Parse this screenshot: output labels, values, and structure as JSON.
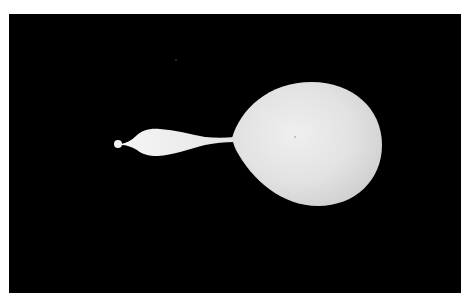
{
  "image": {
    "subject": "liquid droplet with pinching tail (high-speed photograph)",
    "background_color": "#000000",
    "border_color": "#ffffff",
    "droplet_color": "#e6e6e6",
    "highlight_color": "#f4f4f4"
  }
}
